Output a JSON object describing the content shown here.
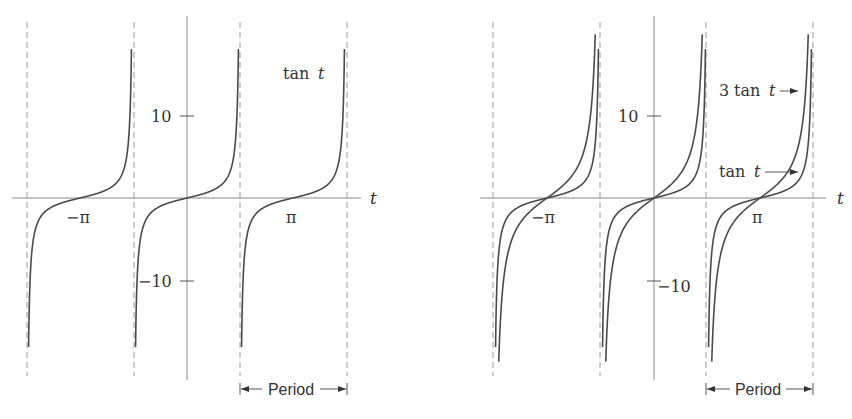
{
  "chart_data": [
    {
      "type": "line",
      "title": "",
      "xlabel": "t",
      "ylabel": "",
      "grid": false,
      "x_tick_labels": [
        "-π",
        "π"
      ],
      "y_tick_labels": [
        "10",
        "-10"
      ],
      "ylim": [
        -20,
        20
      ],
      "xlim": [
        -4.7124,
        4.7124
      ],
      "asymptotes": [
        "-3π/2",
        "-π/2",
        "π/2",
        "3π/2"
      ],
      "series": [
        {
          "name": "tan t",
          "function": "tan(t)",
          "label": "tan t"
        }
      ],
      "annotations": [
        {
          "text": "Period",
          "span": [
            "π/2",
            "3π/2"
          ],
          "style": "double-arrow bracket"
        }
      ]
    },
    {
      "type": "line",
      "title": "",
      "xlabel": "t",
      "ylabel": "",
      "grid": false,
      "x_tick_labels": [
        "-π",
        "π"
      ],
      "y_tick_labels": [
        "10",
        "-10"
      ],
      "ylim": [
        -20,
        20
      ],
      "xlim": [
        -4.7124,
        4.7124
      ],
      "asymptotes": [
        "-3π/2",
        "-π/2",
        "π/2",
        "3π/2"
      ],
      "series": [
        {
          "name": "3 tan t",
          "function": "3*tan(t)",
          "label": "3 tan t"
        },
        {
          "name": "tan t",
          "function": "tan(t)",
          "label": "tan t"
        }
      ],
      "annotations": [
        {
          "text": "Period",
          "span": [
            "π/2",
            "3π/2"
          ],
          "style": "double-arrow bracket"
        }
      ]
    }
  ],
  "left": {
    "axis_label": "t",
    "ytick_pos": "10",
    "ytick_neg": "−10",
    "xtick_neg_pi": "−π",
    "xtick_pi": "π",
    "curve_label_fn": "tan",
    "curve_label_var": "t",
    "period_label": "Period"
  },
  "right": {
    "axis_label": "t",
    "ytick_pos": "10",
    "ytick_neg": "−10",
    "xtick_neg_pi": "−π",
    "xtick_pi": "π",
    "label_3tan_coef": "3",
    "label_3tan_fn": "tan",
    "label_3tan_var": "t",
    "label_tan_fn": "tan",
    "label_tan_var": "t",
    "period_label": "Period"
  },
  "colors": {
    "curve": "#4a4a4a",
    "axis": "#8a8a8a",
    "asymptote": "#9a9a9a",
    "text": "#333333"
  }
}
